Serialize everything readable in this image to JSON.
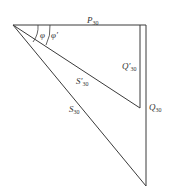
{
  "diagram": {
    "type": "power-triangle",
    "labels": {
      "P30": {
        "main": "P",
        "sub": "30"
      },
      "Q30prime": {
        "main": "Q′",
        "sub": "30"
      },
      "Q30": {
        "main": "Q",
        "sub": "30"
      },
      "S30prime": {
        "main": "S′",
        "sub": "30"
      },
      "S30": {
        "main": "S",
        "sub": "30"
      },
      "phi": {
        "main": "φ"
      },
      "phiprime": {
        "main": "φ′"
      }
    },
    "colors": {
      "line": "#3a3a3a",
      "text": "#333333"
    }
  }
}
